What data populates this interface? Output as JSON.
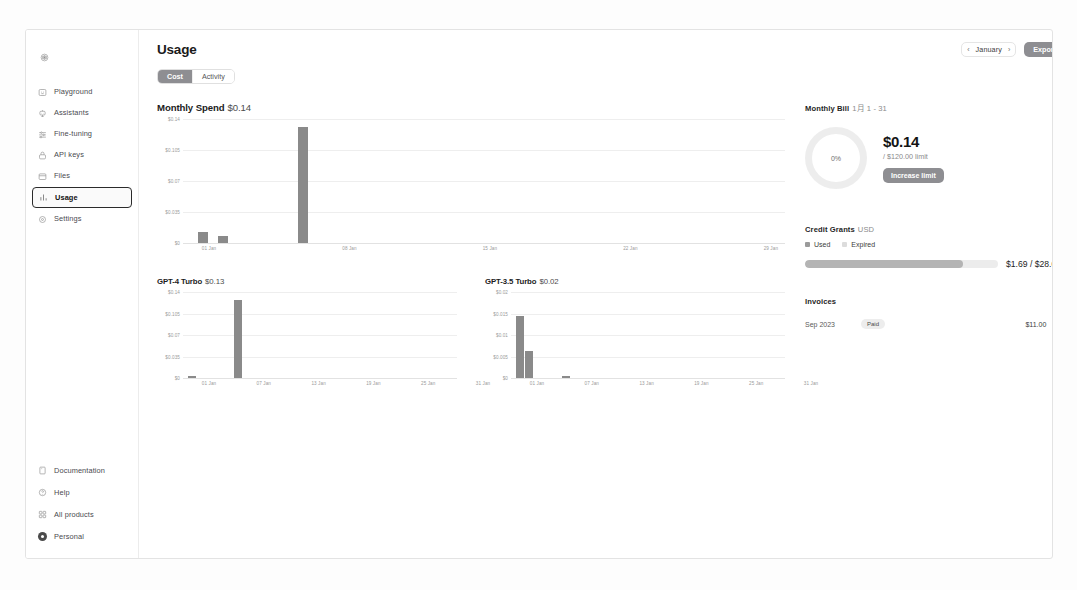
{
  "sidebar": {
    "brand_icon": "openai-logo-icon",
    "items": [
      {
        "label": "Playground",
        "icon": "playground-icon",
        "active": false
      },
      {
        "label": "Assistants",
        "icon": "assistants-icon",
        "active": false
      },
      {
        "label": "Fine-tuning",
        "icon": "fine-tuning-icon",
        "active": false
      },
      {
        "label": "API keys",
        "icon": "lock-icon",
        "active": false
      },
      {
        "label": "Files",
        "icon": "folder-icon",
        "active": false
      },
      {
        "label": "Usage",
        "icon": "bar-chart-icon",
        "active": true
      },
      {
        "label": "Settings",
        "icon": "gear-icon",
        "active": false
      }
    ],
    "bottom_items": [
      {
        "label": "Documentation",
        "icon": "book-icon"
      },
      {
        "label": "Help",
        "icon": "help-icon"
      },
      {
        "label": "All products",
        "icon": "grid-icon"
      },
      {
        "label": "Personal",
        "icon": "avatar-icon"
      }
    ]
  },
  "header": {
    "title": "Usage",
    "tabs": [
      {
        "label": "Cost",
        "active": true
      },
      {
        "label": "Activity",
        "active": false
      }
    ],
    "month_prev_icon": "chevron-left-icon",
    "month_label": "January",
    "month_next_icon": "chevron-right-icon",
    "export_label": "Export"
  },
  "chart_data": [
    {
      "type": "bar",
      "title": "Monthly Spend",
      "title_amount": "$0.14",
      "xlabel": "",
      "ylabel": "",
      "ylim": [
        0,
        0.14
      ],
      "ytick_labels": [
        "$0.14",
        "$0.105",
        "$0.07",
        "$0.035",
        "$0"
      ],
      "ytick_values": [
        0.14,
        0.105,
        0.07,
        0.035,
        0
      ],
      "xtick_labels": [
        "01 Jan",
        "08 Jan",
        "15 Jan",
        "22 Jan",
        "29 Jan"
      ],
      "xtick_days": [
        1,
        8,
        15,
        22,
        29
      ],
      "x_days": [
        1,
        31
      ],
      "grid": true,
      "legend": "none",
      "bars": [
        {
          "day": 2,
          "value": 0.012
        },
        {
          "day": 3,
          "value": 0.008
        },
        {
          "day": 7,
          "value": 0.131
        }
      ]
    },
    {
      "type": "bar",
      "title": "GPT-4 Turbo",
      "title_amount": "$0.13",
      "xlabel": "",
      "ylabel": "",
      "ylim": [
        0,
        0.14
      ],
      "ytick_labels": [
        "$0.14",
        "$0.105",
        "$0.07",
        "$0.035",
        "$0"
      ],
      "ytick_values": [
        0.14,
        0.105,
        0.07,
        0.035,
        0
      ],
      "xtick_labels": [
        "01 Jan",
        "07 Jan",
        "13 Jan",
        "19 Jan",
        "25 Jan",
        "31 Jan"
      ],
      "xtick_days": [
        1,
        7,
        13,
        19,
        25,
        31
      ],
      "x_days": [
        1,
        31
      ],
      "grid": true,
      "legend": "none",
      "bars": [
        {
          "day": 2,
          "value": 0.004
        },
        {
          "day": 7,
          "value": 0.127
        }
      ]
    },
    {
      "type": "bar",
      "title": "GPT-3.5 Turbo",
      "title_amount": "$0.02",
      "xlabel": "",
      "ylabel": "",
      "ylim": [
        0,
        0.02
      ],
      "ytick_labels": [
        "$0.02",
        "$0.015",
        "$0.01",
        "$0.005",
        "$0"
      ],
      "ytick_values": [
        0.02,
        0.015,
        0.01,
        0.005,
        0
      ],
      "xtick_labels": [
        "01 Jan",
        "07 Jan",
        "13 Jan",
        "19 Jan",
        "25 Jan",
        "31 Jan"
      ],
      "xtick_days": [
        1,
        7,
        13,
        19,
        25,
        31
      ],
      "x_days": [
        1,
        31
      ],
      "grid": true,
      "legend": "none",
      "bars": [
        {
          "day": 2,
          "value": 0.0145
        },
        {
          "day": 3,
          "value": 0.0062
        },
        {
          "day": 7,
          "value": 0.0004
        }
      ]
    }
  ],
  "monthly_bill": {
    "heading": "Monthly Bill",
    "range": "1月 1 - 31",
    "percent_label": "0%",
    "percent_value": 0,
    "amount": "$0.14",
    "limit_text": "/ $120.00 limit",
    "increase_limit_label": "Increase limit"
  },
  "credit_grants": {
    "heading": "Credit Grants",
    "currency": "USD",
    "legend": [
      {
        "label": "Used",
        "color": "#9b9b9b"
      },
      {
        "label": "Expired",
        "color": "#dcdcdc"
      }
    ],
    "used_fraction": 0.82,
    "amount": "$1.69 / $28.00"
  },
  "invoices": {
    "heading": "Invoices",
    "rows": [
      {
        "date": "Sep 2023",
        "status": "Paid",
        "amount": "$11.00",
        "chevron_icon": "chevron-right-icon"
      }
    ]
  }
}
